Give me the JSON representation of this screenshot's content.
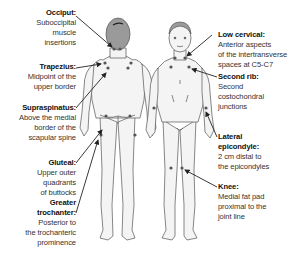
{
  "diagram": {
    "type": "anatomical tender points diagram",
    "views": [
      "posterior",
      "anterior"
    ],
    "colors": {
      "body_fill": "#f4f4f4",
      "outline": "#555555",
      "hair": "#9a9a9a",
      "point": "#555555",
      "arrow": "#222222"
    }
  },
  "labels_left": [
    {
      "title": "Occiput:",
      "desc": "Suboccipital\nmuscle\ninsertions"
    },
    {
      "title": "Trapezius:",
      "desc": "Midpoint of the\nupper border"
    },
    {
      "title": "Supraspinatus:",
      "desc": "Above the medial\nborder of the\nscapular spine"
    },
    {
      "title": "Gluteal:",
      "desc": "Upper outer\nquadrants\nof buttocks"
    },
    {
      "title": "Greater\ntrochanter:",
      "desc": "Posterior to\nthe trochanteric\nprominence"
    }
  ],
  "labels_right": [
    {
      "title": "Low cervical:",
      "desc": "Anterior aspects\nof the intertransverse\nspaces at C5-C7"
    },
    {
      "title": "Second rib:",
      "desc": "Second\ncostochondral\njunctions"
    },
    {
      "title": "Lateral\nepicondyle:",
      "desc": "2 cm distal to\nthe epicondyles"
    },
    {
      "title": "Knee:",
      "desc": "Medial fat pad\nproximal to the\njoint line"
    }
  ]
}
